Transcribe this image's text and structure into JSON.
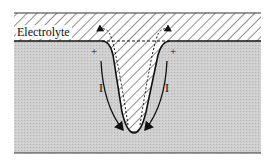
{
  "diagram": {
    "labels": {
      "electrolyte": "Electrolyte",
      "plus_left": "+",
      "plus_right": "+",
      "minus_bottom": "−",
      "current_left": "I",
      "current_right": "I"
    },
    "colors": {
      "metal_fill": "#c9c9c9",
      "electrolyte_fill": "#ffffff",
      "hatch": "#333333",
      "line": "#111111"
    }
  }
}
